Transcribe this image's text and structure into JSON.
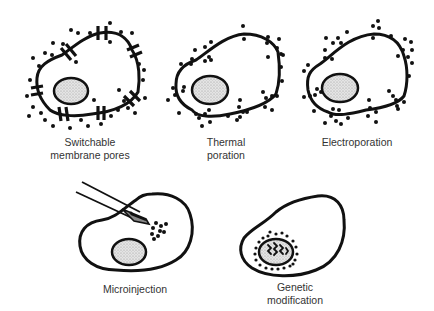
{
  "diagram": {
    "panels": [
      {
        "id": "switchable",
        "label_lines": [
          "Switchable",
          "membrane pores"
        ]
      },
      {
        "id": "thermal",
        "label_lines": [
          "Thermal",
          "poration"
        ]
      },
      {
        "id": "electro",
        "label_lines": [
          "Electroporation"
        ]
      },
      {
        "id": "microinjection",
        "label_lines": [
          "Microinjection"
        ]
      },
      {
        "id": "genetic",
        "label_lines": [
          "Genetic",
          "modification"
        ]
      }
    ]
  }
}
